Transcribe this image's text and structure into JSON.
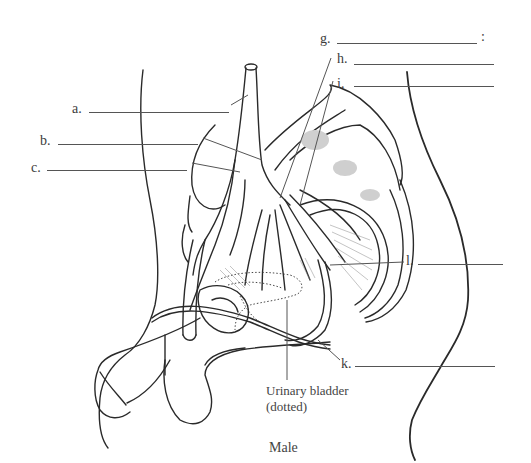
{
  "diagram": {
    "title": "Male",
    "labels": [
      {
        "id": "a",
        "text": "a."
      },
      {
        "id": "b",
        "text": "b."
      },
      {
        "id": "c",
        "text": "c."
      },
      {
        "id": "g",
        "text": "g.",
        "suffix": ":"
      },
      {
        "id": "h",
        "text": "h."
      },
      {
        "id": "i",
        "text": "i."
      },
      {
        "id": "l",
        "text": "l."
      },
      {
        "id": "k",
        "text": "k."
      }
    ],
    "callouts": {
      "urinary_bladder_line1": "Urinary bladder",
      "urinary_bladder_line2": "(dotted)"
    },
    "colors": {
      "line": "#2a2a2a",
      "leader": "#555555",
      "bone_stipple": "#c8c8c8"
    }
  }
}
